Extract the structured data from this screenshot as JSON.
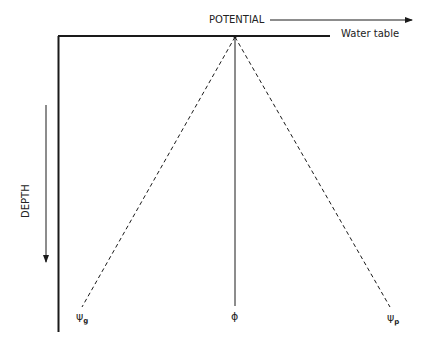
{
  "diagram": {
    "x_axis_label": "POTENTIAL",
    "y_axis_label": "DEPTH",
    "water_table_label": "Water table",
    "symbols": [
      {
        "name": "psi-g",
        "main": "ψ",
        "sub": "g"
      },
      {
        "name": "phi",
        "main": "ϕ",
        "sub": ""
      },
      {
        "name": "psi-p",
        "main": "ψ",
        "sub": "p"
      }
    ],
    "colors": {
      "line": "#1a1a1a",
      "background": "#ffffff"
    }
  }
}
